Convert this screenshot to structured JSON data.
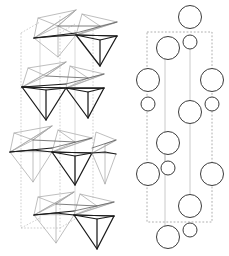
{
  "figure": {
    "background_color": "#ffffff",
    "width": 229,
    "height": 256,
    "panels": [
      {
        "id": "left-panel",
        "name": "polyhedral-tetrahedra-panel",
        "description": "Chain of corner-sharing tetrahedra viewed in projection inside a dashed unit cell"
      },
      {
        "id": "right-panel",
        "name": "ball-model-panel",
        "description": "Ball (sphere) model of the same structure inside a dashed unit cell"
      }
    ]
  },
  "colors": {
    "tetrahedron_dark": "#1a1a1a",
    "tetrahedron_mid": "#5e5e5e",
    "tetrahedron_light": "#a8a8a8",
    "cell_edge": "#b9b9b9",
    "atom_outline": "#3b3b3b",
    "atom_fill": "#ffffff",
    "bond": "#bdbdbd",
    "box_dashed": "#999999"
  },
  "left_panel": {
    "unit_cell": {
      "name": "unit-cell-outline",
      "dashed_verticals_x": [
        21,
        60,
        93
      ],
      "top_y": 33,
      "bottom_y": 228
    },
    "tetrahedra_groups": [
      {
        "name": "tetrahedra-group-1",
        "row": 1,
        "center_y": 30,
        "count": 4,
        "shade": "mixed-dark-light"
      },
      {
        "name": "tetrahedra-group-2",
        "row": 2,
        "center_y": 92,
        "count": 4,
        "shade": "mixed-dark-light"
      },
      {
        "name": "tetrahedra-group-3",
        "row": 3,
        "center_y": 155,
        "count": 4,
        "shade": "mixed-dark-light"
      },
      {
        "name": "tetrahedra-group-4",
        "row": 4,
        "center_y": 218,
        "count": 4,
        "shade": "mixed-dark-light"
      }
    ]
  },
  "right_panel": {
    "unit_cell_box": {
      "name": "unit-cell-box",
      "x": 147,
      "y": 32,
      "width": 65,
      "height": 190,
      "style": "dashed"
    },
    "bond_lines_x": [
      165,
      190
    ],
    "atoms": [
      {
        "name": "atom-large-1",
        "cx": 190,
        "cy": 17,
        "r": 11.5,
        "size": "large"
      },
      {
        "name": "atom-large-2",
        "cx": 168,
        "cy": 48,
        "r": 11.5,
        "size": "large"
      },
      {
        "name": "atom-small-1",
        "cx": 190,
        "cy": 42,
        "r": 7.0,
        "size": "small"
      },
      {
        "name": "atom-large-3",
        "cx": 148,
        "cy": 80,
        "r": 11.5,
        "size": "large"
      },
      {
        "name": "atom-large-4",
        "cx": 212,
        "cy": 80,
        "r": 11.5,
        "size": "large"
      },
      {
        "name": "atom-small-2",
        "cx": 148,
        "cy": 104,
        "r": 7.0,
        "size": "small"
      },
      {
        "name": "atom-small-3",
        "cx": 212,
        "cy": 104,
        "r": 7.0,
        "size": "small"
      },
      {
        "name": "atom-large-5",
        "cx": 190,
        "cy": 112,
        "r": 11.5,
        "size": "large"
      },
      {
        "name": "atom-large-6",
        "cx": 168,
        "cy": 143,
        "r": 11.5,
        "size": "large"
      },
      {
        "name": "atom-small-4",
        "cx": 168,
        "cy": 168,
        "r": 7.0,
        "size": "small"
      },
      {
        "name": "atom-large-7",
        "cx": 148,
        "cy": 174,
        "r": 11.5,
        "size": "large"
      },
      {
        "name": "atom-large-8",
        "cx": 212,
        "cy": 174,
        "r": 11.5,
        "size": "large"
      },
      {
        "name": "atom-large-9",
        "cx": 190,
        "cy": 206,
        "r": 11.5,
        "size": "large"
      },
      {
        "name": "atom-large-10",
        "cx": 168,
        "cy": 237,
        "r": 11.5,
        "size": "large"
      },
      {
        "name": "atom-small-5",
        "cx": 190,
        "cy": 230,
        "r": 7.0,
        "size": "small"
      }
    ]
  }
}
